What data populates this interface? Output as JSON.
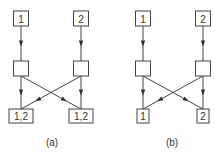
{
  "diagrams": [
    {
      "caption": "(a)",
      "nodes": {
        "top_left": "1",
        "top_right": "2",
        "mid_left": "",
        "mid_right": "",
        "bottom_left": "1,2",
        "bottom_right": "1,2"
      }
    },
    {
      "caption": "(b)",
      "nodes": {
        "top_left": "1",
        "top_right": "2",
        "mid_left": "",
        "mid_right": "",
        "bottom_left": "1",
        "bottom_right": "2"
      }
    }
  ],
  "edges": [
    [
      "top_left",
      "mid_left"
    ],
    [
      "top_right",
      "mid_right"
    ],
    [
      "mid_left",
      "bottom_left"
    ],
    [
      "mid_left",
      "bottom_right"
    ],
    [
      "mid_right",
      "bottom_right"
    ],
    [
      "mid_right",
      "bottom_left"
    ]
  ]
}
